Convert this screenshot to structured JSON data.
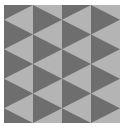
{
  "canvas": {
    "width": 124,
    "height": 140,
    "background": "#ffffff"
  },
  "pattern": {
    "name": "triangle-tessellation",
    "x": 4,
    "y": 5,
    "width": 116,
    "height": 118,
    "columns": 4,
    "column_width": 29,
    "period": 29.5,
    "colors": {
      "light": "#b4b4b4",
      "dark": "#6e6e6e"
    },
    "column_offsets": [
      -14.75,
      0,
      -14.75,
      0
    ]
  }
}
